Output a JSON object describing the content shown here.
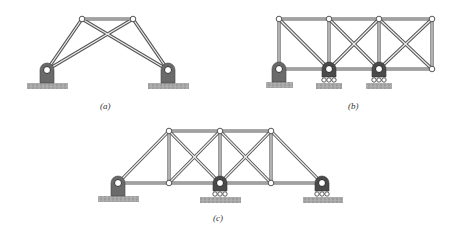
{
  "figure": {
    "type": "truss-diagrams",
    "panels": [
      {
        "id": "a",
        "caption": "(a)",
        "joints_top": [
          [
            82,
            19
          ],
          [
            133,
            19
          ]
        ],
        "supports": [
          {
            "type": "pin",
            "x": 47,
            "y": 70
          },
          {
            "type": "pin",
            "x": 168,
            "y": 70
          }
        ]
      },
      {
        "id": "b",
        "caption": "(b)",
        "joints_top_x": [
          279,
          329,
          379,
          432
        ],
        "top_y": 19,
        "bottom_y": 69,
        "supports": [
          {
            "type": "pin",
            "x": 279
          },
          {
            "type": "roller",
            "x": 329
          },
          {
            "type": "roller",
            "x": 379
          }
        ]
      },
      {
        "id": "c",
        "caption": "(c)",
        "joints_top_x": [
          169,
          220,
          271
        ],
        "top_y": 131,
        "bottom_y": 183,
        "bottom_x": [
          118,
          169,
          220,
          271,
          322
        ],
        "supports": [
          {
            "type": "pin",
            "x": 118
          },
          {
            "type": "roller",
            "x": 220
          },
          {
            "type": "roller",
            "x": 322
          }
        ]
      }
    ]
  },
  "colors": {
    "member": "#555555",
    "member_fill": "#e8e8e8",
    "support": "#666666",
    "ground": "#9a9a9a"
  }
}
